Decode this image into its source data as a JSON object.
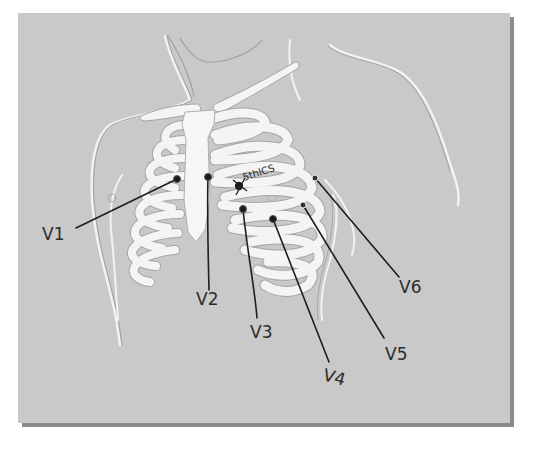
{
  "figure": {
    "background_color": "#c9c9c9",
    "bone_color": "#f4f4f4",
    "outline_color": "#a9a9a9",
    "ink_color": "#1e1e1e"
  },
  "annotation": {
    "landmark_text": "5thICS"
  },
  "electrodes": [
    {
      "id": "V1",
      "label": "V1",
      "x": 177,
      "y": 179,
      "label_x": 42,
      "label_y": 236
    },
    {
      "id": "V2",
      "label": "V2",
      "x": 208,
      "y": 177,
      "label_x": 197,
      "label_y": 304
    },
    {
      "id": "V3",
      "label": "V3",
      "x": 243,
      "y": 209,
      "label_x": 252,
      "label_y": 335
    },
    {
      "id": "V4",
      "label": "V4",
      "x": 273,
      "y": 219,
      "label_x": 323,
      "label_y": 382
    },
    {
      "id": "V5",
      "label": "V5",
      "x": 303,
      "y": 205,
      "label_x": 385,
      "label_y": 357
    },
    {
      "id": "V6",
      "label": "V6",
      "x": 315,
      "y": 178,
      "label_x": 400,
      "label_y": 290
    }
  ]
}
